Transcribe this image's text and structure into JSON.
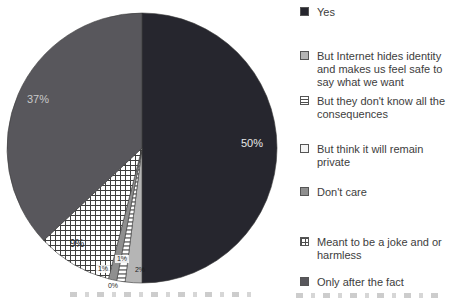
{
  "chart_data": {
    "type": "pie",
    "title": "",
    "legend_position": "right",
    "start_angle_deg": 0,
    "direction": "clockwise",
    "background": "#ffffff",
    "outline_color": "#3b3b3b",
    "slices": [
      {
        "label": "Yes",
        "value": 50,
        "display": "50%",
        "fill": "#26262e"
      },
      {
        "label": "But Internet hides identity and makes us feel safe to say what we want",
        "value": 2,
        "display": "2%",
        "fill": "#b5b5b5"
      },
      {
        "label": "But they don't know all the consequences",
        "value": 1,
        "display": "1%",
        "fill": "pattern:hstripe"
      },
      {
        "label": "But think it will remain private",
        "value": 0,
        "display": "0%",
        "fill": "#f4f4f4"
      },
      {
        "label": "Don't care",
        "value": 1,
        "display": "1%",
        "fill": "#8f8f8f"
      },
      {
        "label": "Meant to be a joke and or harmless",
        "value": 9,
        "display": "9%",
        "fill": "pattern:grid"
      },
      {
        "label": "Only after the fact",
        "value": 37,
        "display": "37%",
        "fill": "#58575c"
      }
    ]
  }
}
